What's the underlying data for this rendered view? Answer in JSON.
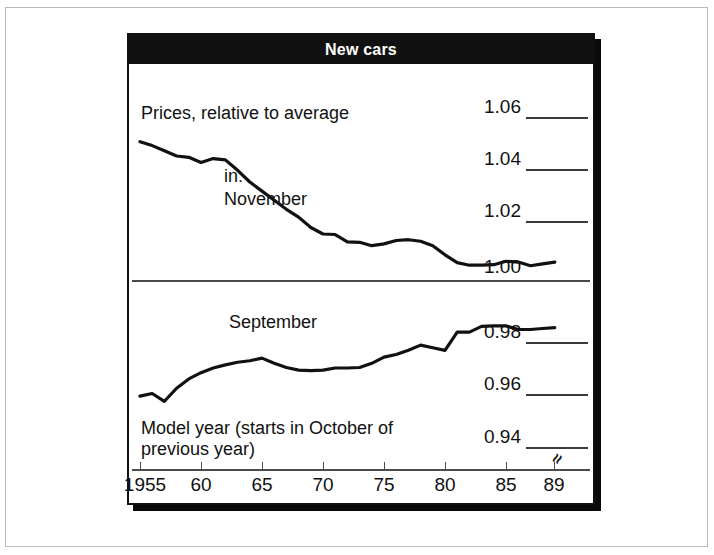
{
  "figure": {
    "title": "New cars",
    "title_bg": "#111111",
    "title_color": "#ffffff",
    "border_color": "#111111",
    "shadow_color": "#0a0a0a"
  },
  "annotations": {
    "top_panel_label": "Prices, relative to average",
    "legend_in": "in:",
    "legend_november": "November",
    "legend_september": "September",
    "xaxis_caption_line1": "Model year (starts in October of",
    "xaxis_caption_line2": "previous year)",
    "axis_break_symbol": "≈"
  },
  "chart_data": {
    "type": "line",
    "title": "New cars",
    "subtitle": "Prices, relative to average",
    "xlabel": "Model year (starts in October of previous year)",
    "ylabel": "",
    "grid": false,
    "legend_position": "inline-annotation",
    "panels": [
      {
        "name": "top",
        "ylim": [
          1.0,
          1.065
        ],
        "yticks": [
          1.06,
          1.04,
          1.02,
          1.0
        ],
        "ytick_labels": [
          "1.06",
          "1.04",
          "1.02",
          "1.00"
        ],
        "series_name": "November"
      },
      {
        "name": "bottom",
        "ylim": [
          0.9325,
          0.9925
        ],
        "yticks": [
          0.98,
          0.96,
          0.94
        ],
        "ytick_labels": [
          "0.98",
          "0.96",
          "0.94"
        ],
        "series_name": "September",
        "axis_break": true
      }
    ],
    "xlim": [
      1955,
      1990
    ],
    "xticks": [
      1955,
      1960,
      1965,
      1970,
      1975,
      1980,
      1985,
      1989
    ],
    "xtick_labels": [
      "1955",
      "60",
      "65",
      "70",
      "75",
      "80",
      "85",
      "89"
    ],
    "x": [
      1955,
      1956,
      1957,
      1958,
      1959,
      1960,
      1961,
      1962,
      1963,
      1964,
      1965,
      1966,
      1967,
      1968,
      1969,
      1970,
      1971,
      1972,
      1973,
      1974,
      1975,
      1976,
      1977,
      1978,
      1979,
      1980,
      1981,
      1982,
      1983,
      1984,
      1985,
      1986,
      1987,
      1988,
      1989
    ],
    "series": [
      {
        "name": "November",
        "panel": "top",
        "values": [
          1.0505,
          1.049,
          1.047,
          1.045,
          1.0445,
          1.0425,
          1.044,
          1.0435,
          1.0395,
          1.035,
          1.0315,
          1.028,
          1.0245,
          1.0215,
          1.0175,
          1.015,
          1.0148,
          1.012,
          1.0118,
          1.0105,
          1.0112,
          1.0125,
          1.0128,
          1.0122,
          1.0105,
          1.007,
          1.004,
          1.003,
          1.003,
          1.0032,
          1.0045,
          1.0042,
          1.0028,
          1.0035,
          1.0042
        ]
      },
      {
        "name": "September",
        "panel": "bottom",
        "values": [
          0.9592,
          0.9602,
          0.9572,
          0.9622,
          0.9658,
          0.9682,
          0.97,
          0.9712,
          0.9722,
          0.9728,
          0.9738,
          0.9718,
          0.9702,
          0.9692,
          0.969,
          0.9692,
          0.97,
          0.97,
          0.9702,
          0.9718,
          0.9742,
          0.9752,
          0.9768,
          0.9788,
          0.9778,
          0.9768,
          0.9838,
          0.9838,
          0.986,
          0.9862,
          0.9862,
          0.9848,
          0.9848,
          0.9852,
          0.9855
        ]
      }
    ]
  }
}
